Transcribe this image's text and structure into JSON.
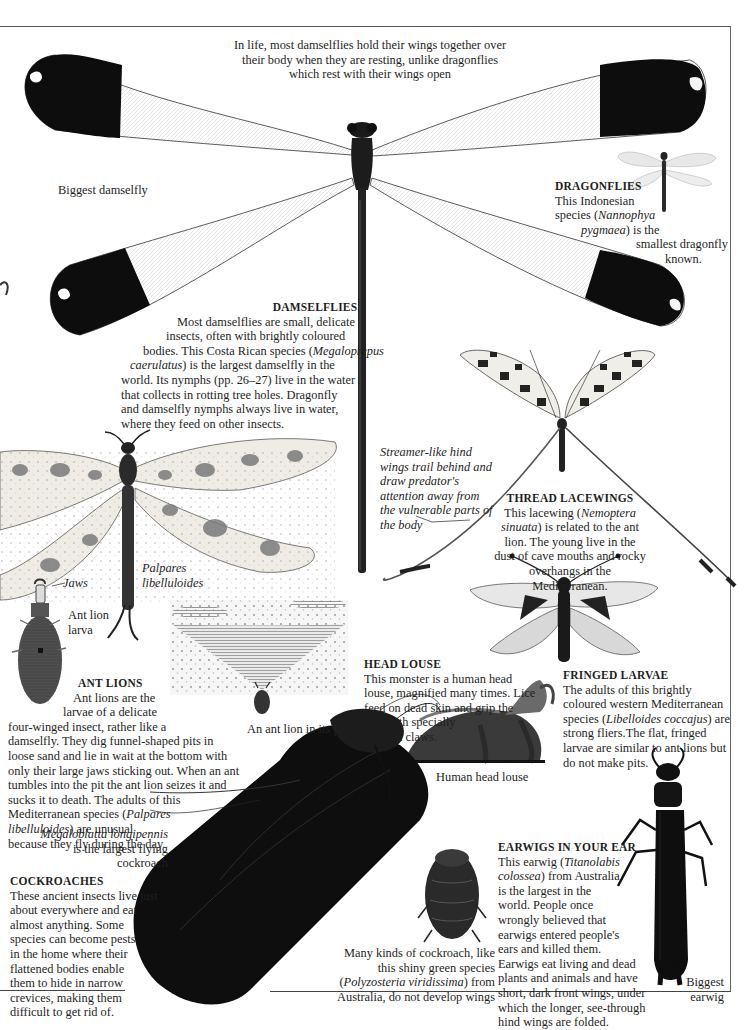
{
  "page": {
    "intro_caption": "In life, most damselflies hold their wings together over their body when they are resting, unlike dragonflies which rest with their wings open",
    "intro_lines": [
      "In life, most damselflies hold their wings together over",
      "their body when they are resting, unlike dragonflies",
      "which rest with their wings open"
    ],
    "colors": {
      "ink": "#1e1e1e",
      "rule": "#555555",
      "background": "#ffffff"
    }
  },
  "labels": {
    "biggest_damselfly": "Biggest damselfly",
    "palpares_1": "Palpares",
    "palpares_2": "libelluloides",
    "jaws": "Jaws",
    "ant_lion_larva_1": "Ant lion",
    "ant_lion_larva_2": "larva",
    "ant_lion_pit": "An ant lion in its pit",
    "human_head_louse": "Human head louse",
    "biggest_earwig_1": "Biggest",
    "biggest_earwig_2": "earwig",
    "megaloblatta_1": "Megaloblatta longipennis",
    "megaloblatta_2": "is the largest flying",
    "megaloblatta_3": "cockroach"
  },
  "sections": {
    "dragonflies": {
      "heading": "DRAGONFLIES",
      "lines": [
        "This Indonesian",
        "species (",
        "Nannophya",
        "pygmaea",
        ") is the",
        "smallest dragonfly",
        "known."
      ]
    },
    "damselflies": {
      "heading": "DAMSELFLIES",
      "lines": [
        "Most damselflies are small, delicate",
        "insects, often with brightly coloured",
        "bodies. This Costa Rican species (",
        "Megaloprepus",
        "caerulatus",
        ") is the largest damselfly in the",
        "world. Its nymphs (pp. 26–27) live in the water",
        "that collects in rotting tree holes. Dragonfly",
        "and damselfly nymphs always live in water,",
        "where they feed on other insects."
      ]
    },
    "streamer_note": {
      "lines": [
        "Streamer-like hind",
        "wings trail behind and",
        "draw predator's",
        "attention away from",
        "the vulnerable parts of",
        "the body"
      ]
    },
    "thread_lacewings": {
      "heading": "THREAD LACEWINGS",
      "lines": [
        "This lacewing (",
        "Nemoptera",
        "sinuata",
        ") is related to the ant",
        "lion. The young live in the",
        "dust of cave mouths and rocky",
        "overhangs in the",
        "Mediterranean."
      ]
    },
    "ant_lions": {
      "heading": "ANT LIONS",
      "lines": [
        "Ant lions are the",
        "larvae of a delicate",
        "four-winged insect, rather like a",
        "damselfly. They dig funnel-shaped pits in",
        "loose sand and lie in wait at the bottom with",
        "only their large jaws sticking out. When an ant",
        "tumbles into the pit the ant lion seizes it and",
        "sucks it to death. The adults of this",
        "Mediterranean species (",
        "Palpares",
        "libelluloides",
        ") are unusual",
        "because they fly during the day."
      ]
    },
    "head_louse": {
      "heading": "HEAD LOUSE",
      "lines": [
        "This monster is a human head",
        "louse, magnified many times. Lice",
        "feed on dead skin and grip the",
        "hair with specially",
        "adapted claws."
      ]
    },
    "fringed_larvae": {
      "heading": "FRINGED LARVAE",
      "lines": [
        "The adults of this brightly",
        "coloured western Mediterranean",
        "species (",
        "Libelloides coccajus",
        ") are",
        "strong fliers.The flat, fringed",
        "larvae are similar to ant lions but",
        "do not make pits."
      ]
    },
    "cockroaches": {
      "heading": "COCKROACHES",
      "lines": [
        "These ancient insects live just",
        "about everywhere and eat",
        "almost anything. Some",
        "species can become pests",
        "in the home where their",
        "flattened bodies enable",
        "them to hide in narrow",
        "crevices, making them",
        "difficult to get rid of."
      ]
    },
    "wingless_cockroach": {
      "lines": [
        "Many kinds of cockroach, like",
        "this shiny green species",
        "(",
        "Polyzosteria viridissima",
        ") from",
        "Australia, do not develop wings"
      ]
    },
    "earwigs": {
      "heading": "EARWIGS IN YOUR EAR",
      "lines": [
        "This earwig (",
        "Titanolabis",
        "colossea",
        ") from Australia",
        "is the largest in the",
        "world. People once",
        "wrongly believed that",
        "earwigs entered people's",
        "ears and killed them.",
        "Earwigs eat living and dead",
        "plants and animals and have",
        "short, dark front wings, under",
        "which the longer, see-through",
        "hind wings are folded."
      ]
    }
  },
  "illustrations": [
    "giant-damselfly-megaloprepus",
    "small-dragonfly-nannophya",
    "thread-lacewing-nemoptera",
    "ant-lion-adult-palpares",
    "ant-lion-larva",
    "ant-lion-pit-engraving",
    "fringed-larva-libelloides",
    "human-head-louse",
    "giant-cockroach-megaloblatta",
    "wingless-cockroach-polyzosteria",
    "giant-earwig-titanolabis"
  ]
}
